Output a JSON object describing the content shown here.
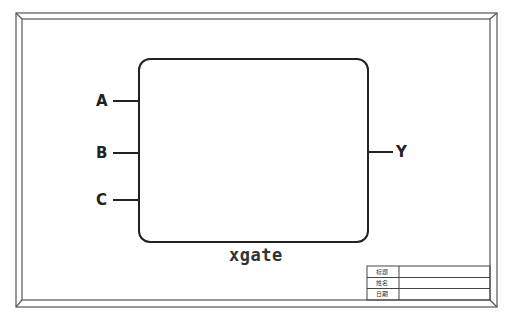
{
  "diagram": {
    "type": "logic-gate-schematic",
    "gate": {
      "name": "xgate",
      "inputs": [
        "A",
        "B",
        "C"
      ],
      "outputs": [
        "Y"
      ]
    },
    "title_block": {
      "rows": [
        {
          "label": "标题",
          "value": ""
        },
        {
          "label": "姓名",
          "value": ""
        },
        {
          "label": "日期",
          "value": ""
        }
      ]
    },
    "colors": {
      "stroke": "#222222",
      "frame": "#555555",
      "background": "#ffffff"
    }
  }
}
